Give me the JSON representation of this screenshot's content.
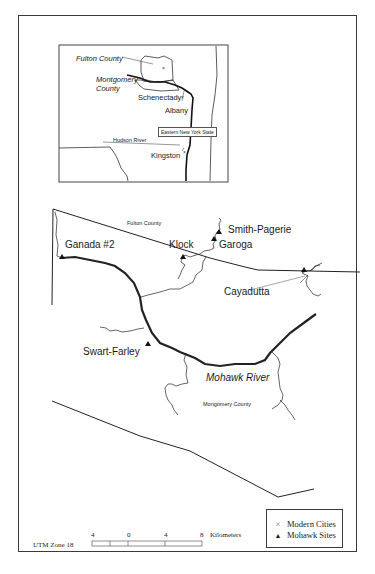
{
  "inset_map": {
    "labels": {
      "fulton_county": "Fulton County",
      "montgomery_county_line1": "Montgomery",
      "montgomery_county_line2": "County",
      "schenectady": "Schenectady",
      "albany": "Albany",
      "region_box": "Eastern New York State",
      "hudson_river": "Hudson River",
      "kingston": "Kingston"
    }
  },
  "main_map": {
    "county_labels": {
      "fulton": "Fulton County",
      "montgomery": "Mongomery County"
    },
    "river_label": "Mohawk River",
    "sites": [
      {
        "name": "Ganada #2",
        "type": "mohawk-site"
      },
      {
        "name": "Klock",
        "type": "mohawk-site"
      },
      {
        "name": "Smith-Pagerie",
        "type": "mohawk-site"
      },
      {
        "name": "Garoga",
        "type": "mohawk-site"
      },
      {
        "name": "Cayadutta",
        "type": "mohawk-site"
      },
      {
        "name": "Swart-Farley",
        "type": "mohawk-site"
      }
    ]
  },
  "scale_bar": {
    "projection": "UTM Zone 18",
    "ticks": [
      "4",
      "0",
      "4",
      "8"
    ],
    "unit": "Kilometers"
  },
  "legend": {
    "items": [
      {
        "symbol": "×",
        "label": "Modern Cities",
        "icon": "x-mark-icon"
      },
      {
        "symbol": "▲",
        "label": "Mohawk Sites",
        "icon": "triangle-icon"
      }
    ]
  },
  "colors": {
    "line": "#222222",
    "frame": "#3a3a3a",
    "background": "#ffffff"
  }
}
